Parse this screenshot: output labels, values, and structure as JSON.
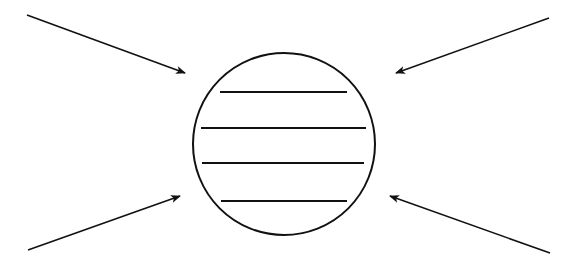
{
  "diagram": {
    "background": "#ffffff",
    "stroke": "#111111",
    "circle": {
      "cx": 284,
      "cy": 144,
      "r": 91
    },
    "lines": [
      {
        "x1": 220,
        "y1": 92,
        "x2": 347,
        "y2": 92
      },
      {
        "x1": 201,
        "y1": 128,
        "x2": 366,
        "y2": 128
      },
      {
        "x1": 202,
        "y1": 163,
        "x2": 364,
        "y2": 163
      },
      {
        "x1": 221,
        "y1": 201,
        "x2": 347,
        "y2": 201
      }
    ],
    "arrows": [
      {
        "name": "arrow-top-left",
        "x1": 27,
        "y1": 15,
        "x2": 185,
        "y2": 73
      },
      {
        "name": "arrow-top-right",
        "x1": 549,
        "y1": 18,
        "x2": 396,
        "y2": 73
      },
      {
        "name": "arrow-bottom-left",
        "x1": 28,
        "y1": 250,
        "x2": 180,
        "y2": 196
      },
      {
        "name": "arrow-bottom-right",
        "x1": 550,
        "y1": 253,
        "x2": 390,
        "y2": 196
      }
    ]
  }
}
